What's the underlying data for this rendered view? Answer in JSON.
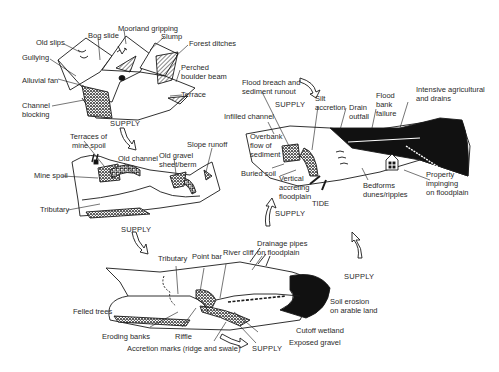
{
  "diagram": {
    "panels": [
      {
        "id": "upland",
        "labels": {
          "old_slips": "Old slips",
          "bog_slide": "Bog slide",
          "moorland_gripping": "Moorland gripping",
          "slump": "Slump",
          "forest_ditches": "Forest ditches",
          "gullying": "Gullying",
          "perched_boulder_beam": [
            "Perched",
            "boulder beam"
          ],
          "alluvial_fan": "Alluvial fan",
          "terrace": "Terrace",
          "channel_blocking": [
            "Channel",
            "blocking"
          ]
        }
      },
      {
        "id": "mining",
        "labels": {
          "terraces_of_mine_spoil": [
            "Terraces of",
            "mine spoil"
          ],
          "old_channel": "Old channel",
          "old_gravel_sheet": [
            "Old gravel",
            "sheet/berm"
          ],
          "slope_runoff": "Slope runoff",
          "mine_spoil": "Mine spoil",
          "tributary": "Tributary"
        }
      },
      {
        "id": "lowland",
        "labels": {
          "tributary": "Tributary",
          "point_bar": "Point bar",
          "river_cliff": "River cliff",
          "drainage_pipes": [
            "Drainage pipes",
            "on floodplain"
          ],
          "felled_trees": "Felled trees",
          "soil_erosion": [
            "Soil erosion",
            "on arable land"
          ],
          "eroding_banks": "Eroding banks",
          "riffle": "Riffle",
          "cutoff_wetland": "Cutoff  wetland",
          "exposed_gravel": "Exposed  gravel",
          "accretion_marks": "Accretion marks  (ridge and swale)"
        }
      },
      {
        "id": "estuary",
        "labels": {
          "flood_breach": [
            "Flood breach and",
            "sediment runout"
          ],
          "silt_accretion": [
            "Silt",
            "accretion"
          ],
          "drain_outfall": [
            "Drain",
            "outfall"
          ],
          "flood_bank_failure": [
            "Flood",
            "bank",
            "failure"
          ],
          "intensive_agricultural": [
            "Intensive agricultural",
            "and drains"
          ],
          "infilled_channel": "Infilled channel",
          "overbank_flow": [
            "Overbank",
            "flow of",
            "sediment"
          ],
          "buried_soil": "Buried soil",
          "vertical_accreting": [
            "Vertical",
            "accreting",
            "floodplain"
          ],
          "bedforms": [
            "Bedforms",
            "dunes/ripples"
          ],
          "property_impinging": [
            "Property",
            "impinging",
            "on floodplain"
          ],
          "tide": "TIDE"
        }
      }
    ],
    "flow_arrows": {
      "supply_1": "SUPPLY",
      "supply_2": "SUPPLY",
      "supply_3": "SUPPLY",
      "supply_4": "SUPPLY",
      "supply_5": "SUPPLY",
      "supply_6": "SUPPLY"
    },
    "colors": {
      "ink": "#1a1a1a",
      "text": "#2a2a2a",
      "background": "#ffffff"
    }
  }
}
